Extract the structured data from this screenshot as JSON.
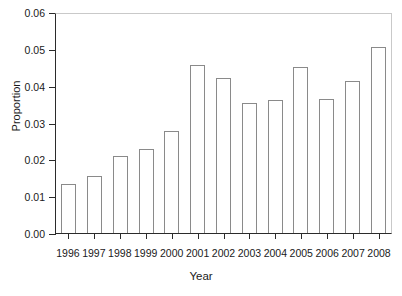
{
  "chart_data": {
    "type": "bar",
    "title": "",
    "xlabel": "Year",
    "ylabel": "Proportion",
    "categories": [
      "1996",
      "1997",
      "1998",
      "1999",
      "2000",
      "2001",
      "2002",
      "2003",
      "2004",
      "2005",
      "2006",
      "2007",
      "2008"
    ],
    "values": [
      0.0132,
      0.0155,
      0.0208,
      0.0228,
      0.0278,
      0.0455,
      0.0422,
      0.0352,
      0.0362,
      0.045,
      0.0363,
      0.0412,
      0.0505
    ],
    "ylim": [
      0.0,
      0.06
    ],
    "ytick_values": [
      0.0,
      0.01,
      0.02,
      0.03,
      0.04,
      0.05,
      0.06
    ],
    "ytick_labels": [
      "0.00",
      "0.01",
      "0.02",
      "0.03",
      "0.04",
      "0.05",
      "0.06"
    ],
    "grid": false,
    "legend": null,
    "bar_fill_color": "#ffffff",
    "bar_edge_color": "#8a8a8a",
    "axis_color": "#2b2b2b"
  }
}
